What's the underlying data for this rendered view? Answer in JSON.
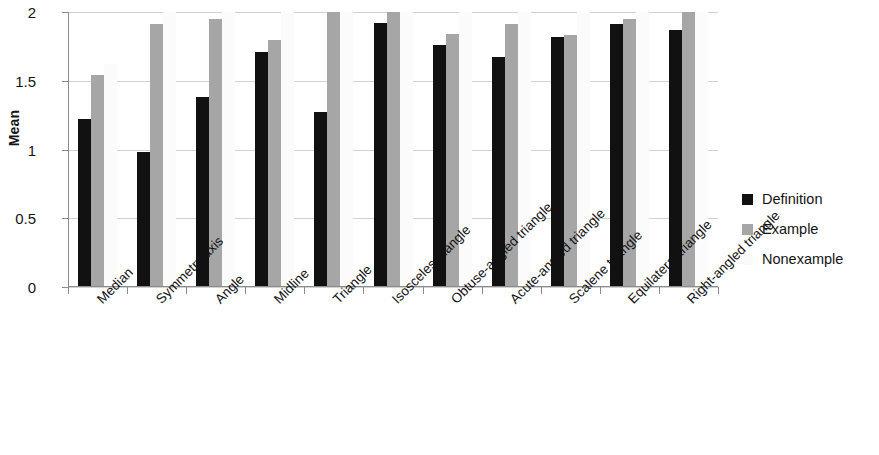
{
  "chart_data": {
    "type": "bar",
    "title": "",
    "subtitle": "",
    "xlabel": "",
    "ylabel": "Mean",
    "ylim": [
      0,
      2
    ],
    "yticks": [
      "0",
      "0.5",
      "1",
      "1.5",
      "2"
    ],
    "ytick_values": [
      0,
      0.5,
      1,
      1.5,
      2
    ],
    "grid": true,
    "legend_position": "right",
    "categories": [
      "Median",
      "Symmetry axis",
      "Angle",
      "Midline",
      "Triangle",
      "Isosceles triangle",
      "Obtuse-angled triangle",
      "Acute-angled triangle",
      "Scalene triangle",
      "Equilateral triangle",
      "Right-angled triangle"
    ],
    "series": [
      {
        "name": "Definition",
        "color": "#111111",
        "values": [
          1.22,
          0.98,
          1.38,
          1.71,
          1.27,
          1.92,
          1.76,
          1.67,
          1.82,
          1.91,
          1.87
        ]
      },
      {
        "name": "Example",
        "color": "#a6a6a6",
        "values": [
          1.54,
          1.91,
          1.95,
          1.8,
          2.0,
          2.0,
          1.84,
          1.91,
          1.83,
          1.95,
          2.0
        ]
      },
      {
        "name": "Nonexample",
        "color": "#fbfbfb",
        "values": [
          1.62,
          2.0,
          2.0,
          2.0,
          2.0,
          2.0,
          2.0,
          2.0,
          2.0,
          2.0,
          2.0
        ]
      }
    ]
  },
  "legend": {
    "items": [
      {
        "label": "Definition",
        "swatch": "legend-swatch-definition"
      },
      {
        "label": "Example",
        "swatch": "legend-swatch-example"
      },
      {
        "label": "Nonexample",
        "swatch": "legend-swatch-nonexample"
      }
    ]
  },
  "axes": {
    "y_title": "Mean"
  }
}
